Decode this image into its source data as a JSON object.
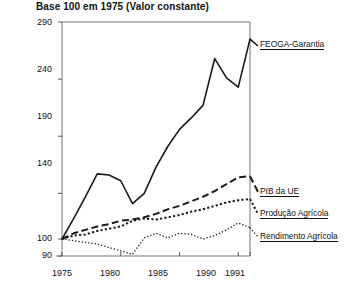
{
  "chart_data": {
    "type": "line",
    "title": "Base 100 em 1975 (Valor constante)",
    "xlabel": "",
    "ylabel": "",
    "xlim": [
      1975,
      1991
    ],
    "ylim": [
      90,
      290
    ],
    "grid": false,
    "legend_position": "right-inline",
    "x": [
      1975,
      1976,
      1977,
      1978,
      1979,
      1980,
      1981,
      1982,
      1983,
      1984,
      1985,
      1986,
      1987,
      1988,
      1989,
      1990,
      1991
    ],
    "y_ticks": [
      90,
      100,
      140,
      190,
      240,
      290
    ],
    "y_tick_labels": [
      "90",
      "100",
      "140",
      "190",
      "240",
      "290"
    ],
    "x_ticks": [
      1975,
      1980,
      1985,
      1990,
      1991
    ],
    "x_tick_labels": [
      "1975",
      "1980",
      "1985",
      "1990",
      "1991"
    ],
    "series": [
      {
        "name": "FEOGA-Garantia",
        "style": "solid",
        "values": [
          100,
          118,
          137,
          157,
          156,
          151,
          131,
          140,
          163,
          181,
          196,
          206,
          217,
          258,
          241,
          233,
          275
        ]
      },
      {
        "name": "PIB da UE",
        "style": "dashed",
        "values": [
          100,
          105,
          108,
          111,
          113,
          116,
          117,
          119,
          122,
          126,
          129,
          133,
          137,
          142,
          148,
          154,
          155
        ]
      },
      {
        "name": "Produção Agrícola",
        "style": "dotted",
        "values": [
          100,
          103,
          104,
          107,
          109,
          111,
          116,
          118,
          117,
          119,
          121,
          124,
          126,
          129,
          132,
          134,
          135
        ]
      },
      {
        "name": "Rendimento Agrícola",
        "style": "fine-dotted",
        "values": [
          100,
          99,
          98,
          97,
          95,
          93,
          91,
          101,
          105,
          101,
          105,
          104,
          100,
          103,
          108,
          114,
          110
        ]
      }
    ]
  },
  "labels": {
    "feoga": "FEOGA-Garantia",
    "pib": "PIB da UE",
    "producao": "Produção Agrícola",
    "rendimento": "Rendimento Agrícola"
  },
  "y_labels": {
    "t290": "290",
    "t240": "240",
    "t190": "190",
    "t140": "140",
    "t100": "100",
    "t90": "90"
  },
  "x_labels": {
    "t1975": "1975",
    "t1980": "1980",
    "t1985": "1985",
    "t1990": "1990",
    "t1991": "1991"
  },
  "colors": {
    "line": "#1a1a1a",
    "axis": "#555555",
    "text": "#111111",
    "background": "#ffffff"
  }
}
